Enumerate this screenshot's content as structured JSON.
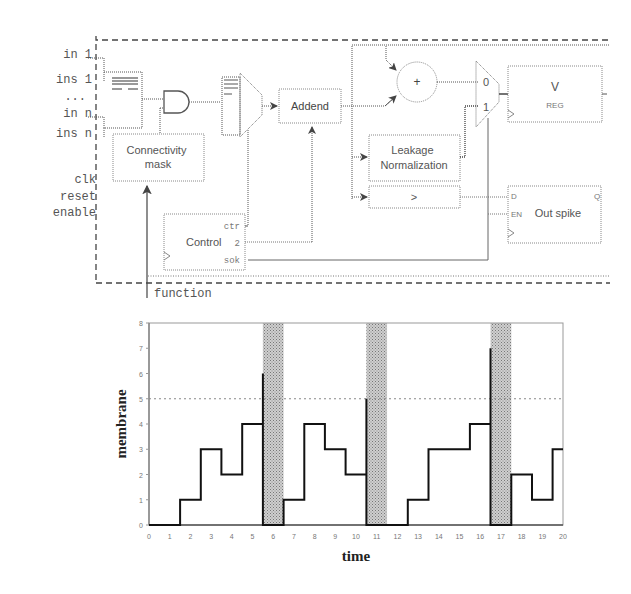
{
  "diagram": {
    "input_labels": [
      "in 1",
      "ins 1",
      "...",
      "in n",
      "ins n",
      "clk",
      "reset",
      "enable"
    ],
    "blocks": {
      "connectivity_mask": [
        "Connectivity",
        "mask"
      ],
      "addend": "Addend",
      "adder_symbol": "+",
      "leakage": [
        "Leakage",
        "Normalization"
      ],
      "comparator": ">",
      "mux_in0": "0",
      "mux_in1": "1",
      "vreg_title": "V",
      "vreg_sub": "REG",
      "out_spike": "Out spike",
      "out_spike_d": "D",
      "out_spike_en": "EN",
      "out_spike_q": "Q",
      "control": "Control",
      "control_ctr": "ctr",
      "control_2": "2",
      "control_sok": "sok",
      "function_label": "function"
    }
  },
  "chart_data": {
    "type": "line",
    "subtype": "step",
    "title": "",
    "xlabel": "time",
    "ylabel": "membrane",
    "xlim": [
      0,
      20
    ],
    "ylim": [
      0,
      8
    ],
    "x_ticks": [
      "0",
      "1",
      "2",
      "3",
      "4",
      "5",
      "6",
      "7",
      "8",
      "9",
      "10",
      "11",
      "12",
      "13",
      "14",
      "15",
      "16",
      "17",
      "18",
      "19",
      "20"
    ],
    "y_ticks": [
      "0",
      "1",
      "2",
      "3",
      "4",
      "5",
      "6",
      "7",
      "8"
    ],
    "threshold": 5,
    "refractory_bands": [
      [
        5.5,
        6.5
      ],
      [
        10.5,
        11.5
      ],
      [
        16.5,
        17.5
      ]
    ],
    "series": [
      {
        "name": "membrane",
        "points": [
          [
            0,
            0
          ],
          [
            1.5,
            0
          ],
          [
            1.5,
            1
          ],
          [
            2.5,
            1
          ],
          [
            2.5,
            3
          ],
          [
            3.5,
            3
          ],
          [
            3.5,
            2
          ],
          [
            4.5,
            2
          ],
          [
            4.5,
            4
          ],
          [
            5.5,
            4
          ],
          [
            5.5,
            6
          ],
          [
            5.5,
            0
          ],
          [
            6.5,
            0
          ],
          [
            6.5,
            1
          ],
          [
            7.5,
            1
          ],
          [
            7.5,
            4
          ],
          [
            8.5,
            4
          ],
          [
            8.5,
            3
          ],
          [
            9.5,
            3
          ],
          [
            9.5,
            2
          ],
          [
            10.5,
            2
          ],
          [
            10.5,
            5
          ],
          [
            10.5,
            0
          ],
          [
            12.5,
            0
          ],
          [
            12.5,
            1
          ],
          [
            13.5,
            1
          ],
          [
            13.5,
            3
          ],
          [
            15.5,
            3
          ],
          [
            15.5,
            4
          ],
          [
            16.5,
            4
          ],
          [
            16.5,
            7
          ],
          [
            16.5,
            0
          ],
          [
            17.5,
            0
          ],
          [
            17.5,
            2
          ],
          [
            18.5,
            2
          ],
          [
            18.5,
            1
          ],
          [
            19.5,
            1
          ],
          [
            19.5,
            3
          ],
          [
            20,
            3
          ]
        ]
      }
    ],
    "grid": false,
    "legend": null
  }
}
